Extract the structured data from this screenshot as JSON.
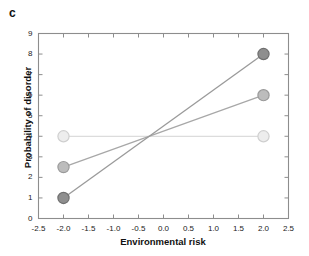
{
  "figure": {
    "panel_label": "c",
    "background_color": "#ffffff"
  },
  "chart_data": {
    "type": "line",
    "title": "",
    "subtitle": "",
    "panel": "c",
    "xlabel": "Environmental risk",
    "ylabel": "Probability of disorder",
    "xlim": [
      -2.5,
      2.5
    ],
    "ylim": [
      0,
      9
    ],
    "xticks": [
      -2.5,
      -2.0,
      -1.5,
      -1.0,
      -0.5,
      0.0,
      0.5,
      1.0,
      1.5,
      2.0,
      2.5
    ],
    "xtick_labels": [
      "-2.5",
      "-2.0",
      "-1.5",
      "-1.0",
      "-0.5",
      "0.0",
      "0.5",
      "1.0",
      "1.5",
      "2.0",
      "2.5"
    ],
    "yticks": [
      0,
      1,
      2,
      3,
      4,
      5,
      6,
      7,
      8,
      9
    ],
    "ytick_labels": [
      "0",
      "1",
      "2",
      "3",
      "4",
      "5",
      "6",
      "7",
      "8",
      "9"
    ],
    "grid": false,
    "legend": null,
    "legend_position": "none",
    "frame": "box",
    "x": [
      -2.0,
      2.0
    ],
    "series": [
      {
        "name": "steep-slope-group",
        "values": [
          1.0,
          8.0
        ],
        "marker": "circle",
        "marker_color": "#8e8e8e",
        "marker_edge_color": "#6f6f6f",
        "line_color": "#9a9a9a"
      },
      {
        "name": "moderate-slope-group",
        "values": [
          2.5,
          6.0
        ],
        "marker": "circle",
        "marker_color": "#bcbcbc",
        "marker_edge_color": "#9a9a9a",
        "line_color": "#a8a8a8"
      },
      {
        "name": "flat-group",
        "values": [
          4.0,
          4.0
        ],
        "marker": "circle",
        "marker_color": "#ededed",
        "marker_edge_color": "#cfcfcf",
        "line_color": "#dcdcdc"
      }
    ],
    "annotations": [
      {
        "text": "lines intersect near x = -0.3, y = 4.0"
      }
    ]
  },
  "axes_style": {
    "axis_color": "#8d8d8d",
    "tick_color": "#8d8d8d",
    "text_color": "#1a1a1a"
  }
}
